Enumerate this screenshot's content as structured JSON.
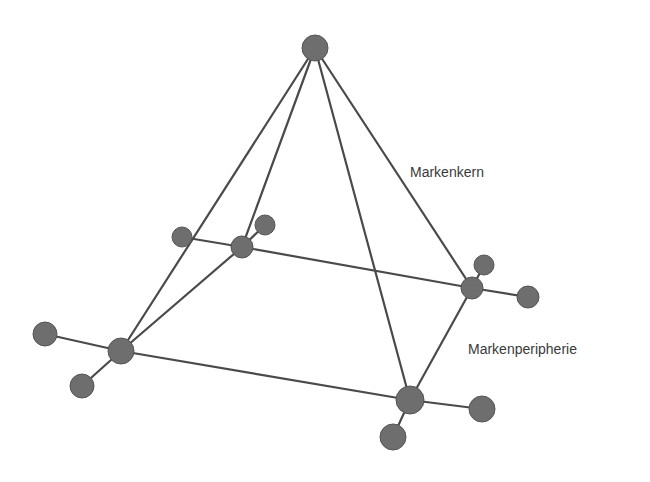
{
  "diagram": {
    "type": "pyramid-network",
    "labels": {
      "core": "Markenkern",
      "periphery": "Markenperipherie"
    },
    "colors": {
      "node": "#6e6e6e",
      "edge": "#4a4a4a",
      "text": "#3a3a3a",
      "background": "#ffffff"
    },
    "nodes": [
      {
        "id": "apex",
        "x": 315,
        "y": 48,
        "r": 13
      },
      {
        "id": "back-left",
        "x": 242,
        "y": 247,
        "r": 11
      },
      {
        "id": "back-left-sat-a",
        "x": 182,
        "y": 237,
        "r": 10
      },
      {
        "id": "back-left-sat-b",
        "x": 265,
        "y": 225,
        "r": 10
      },
      {
        "id": "right",
        "x": 472,
        "y": 288,
        "r": 11
      },
      {
        "id": "right-sat-a",
        "x": 484,
        "y": 265,
        "r": 10
      },
      {
        "id": "right-sat-b",
        "x": 528,
        "y": 297,
        "r": 11
      },
      {
        "id": "front-left",
        "x": 121,
        "y": 351,
        "r": 13
      },
      {
        "id": "front-left-sat-a",
        "x": 45,
        "y": 334,
        "r": 12
      },
      {
        "id": "front-left-sat-b",
        "x": 82,
        "y": 386,
        "r": 12
      },
      {
        "id": "front-right",
        "x": 410,
        "y": 400,
        "r": 14
      },
      {
        "id": "front-right-sat-a",
        "x": 482,
        "y": 409,
        "r": 13
      },
      {
        "id": "front-right-sat-b",
        "x": 393,
        "y": 437,
        "r": 13
      }
    ],
    "edges": [
      [
        "apex",
        "front-left"
      ],
      [
        "apex",
        "back-left"
      ],
      [
        "apex",
        "front-right"
      ],
      [
        "apex",
        "right"
      ],
      [
        "back-left",
        "front-left"
      ],
      [
        "right",
        "front-right"
      ],
      [
        "back-left-sat-a",
        "back-left"
      ],
      [
        "back-left",
        "right"
      ],
      [
        "right",
        "right-sat-b"
      ],
      [
        "back-left",
        "back-left-sat-b"
      ],
      [
        "right",
        "right-sat-a"
      ],
      [
        "front-left-sat-a",
        "front-left"
      ],
      [
        "front-left",
        "front-right"
      ],
      [
        "front-right",
        "front-right-sat-a"
      ],
      [
        "front-left",
        "front-left-sat-b"
      ],
      [
        "front-right",
        "front-right-sat-b"
      ]
    ]
  }
}
